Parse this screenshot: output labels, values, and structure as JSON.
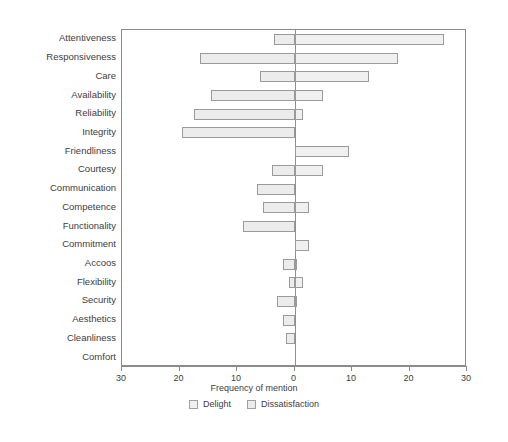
{
  "chart_data": {
    "type": "bar",
    "orientation": "horizontal",
    "style": "diverging-tornado",
    "title": "",
    "xlabel": "Frequency of mention",
    "ylabel": "",
    "xlim": [
      -30,
      30
    ],
    "xticks": [
      -30,
      -20,
      -10,
      0,
      10,
      20,
      30
    ],
    "xticklabels": [
      "30",
      "20",
      "10",
      "0",
      "10",
      "20",
      "30"
    ],
    "grid": false,
    "legend_position": "bottom",
    "legend": [
      "Delight",
      "Dissatisfaction"
    ],
    "categories": [
      "Attentiveness",
      "Responsiveness",
      "Care",
      "Availability",
      "Reliability",
      "Integrity",
      "Friendliness",
      "Courtesy",
      "Communication",
      "Competence",
      "Functionality",
      "Commitment",
      "Accoos",
      "Flexibility",
      "Security",
      "Aesthetics",
      "Cleanliness",
      "Comfort"
    ],
    "series": [
      {
        "name": "Delight",
        "values": [
          26,
          18,
          13,
          5,
          1.5,
          0,
          9.5,
          5,
          0,
          2.5,
          0,
          2.5,
          0.5,
          1.5,
          0.5,
          0,
          0,
          0
        ]
      },
      {
        "name": "Dissatisfaction",
        "values": [
          3.5,
          16.5,
          6,
          14.5,
          17.5,
          19.5,
          0,
          4,
          6.5,
          5.5,
          9,
          0,
          2,
          1,
          3,
          2,
          1.5,
          0
        ]
      }
    ]
  },
  "axis": {
    "x_title": "Frequency of mention"
  },
  "legend": {
    "items": [
      {
        "label": "Delight",
        "swatch_name": "delight-swatch",
        "color": "#f0f0f0"
      },
      {
        "label": "Dissatisfaction",
        "swatch_name": "dissatisfaction-swatch",
        "color": "#ececec"
      }
    ]
  },
  "caption": {
    "text": ""
  },
  "colors": {
    "delight_fill": "#f0f0f0",
    "dissatisfaction_fill": "#ececec",
    "bar_border": "#9a9a9a",
    "axis": "#8a8a8a",
    "text": "#3d3d3d"
  }
}
